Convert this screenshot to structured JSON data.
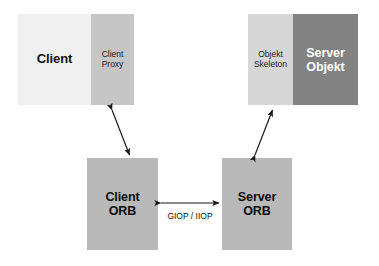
{
  "diagram": {
    "background_color": "#ffffff"
  },
  "nodes": {
    "client": {
      "label": "Client",
      "fill": "#f0f0f0",
      "text_color": "#111111"
    },
    "client_proxy": {
      "label": "Client\nProxy",
      "line1": "Client",
      "line2": "Proxy",
      "fill": "#c6c6c6",
      "text_color": "#1a1a1a"
    },
    "objekt_skeleton": {
      "label": "Objekt\nSkeleton",
      "line1": "Objekt",
      "line2": "Skeleton",
      "fill": "#d7d7d7",
      "text_color": "#1a1a1a"
    },
    "server_objekt": {
      "label": "Server\nObjekt",
      "line1": "Server",
      "line2": "Objekt",
      "fill": "#828282",
      "text_color": "#ffffff"
    },
    "client_orb": {
      "label": "Client\nORB",
      "line1": "Client",
      "line2": "ORB",
      "fill": "#b9b9b9",
      "text_color": "#0d0d0d"
    },
    "server_orb": {
      "label": "Server\nORB",
      "line1": "Server",
      "line2": "ORB",
      "fill": "#b9b9b9",
      "text_color": "#0d0d0d"
    }
  },
  "connections": {
    "client_proxy_to_client_orb": {
      "style": "double-headed-arrow",
      "label": ""
    },
    "server_orb_to_objekt_skeleton": {
      "style": "double-headed-arrow",
      "label": ""
    },
    "orb_to_orb": {
      "style": "double-headed-arrow",
      "label": "GIOP / IIOP"
    }
  },
  "stroke_color": "#1a1a1a"
}
